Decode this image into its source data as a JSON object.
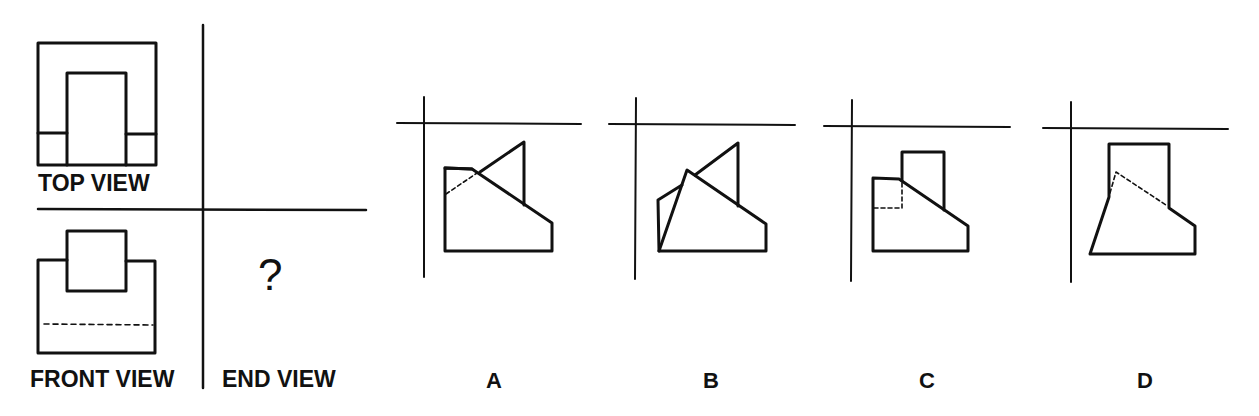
{
  "question": {
    "views": {
      "top_label": "TOP VIEW",
      "front_label": "FRONT VIEW",
      "end_label": "END VIEW",
      "unknown_mark": "?"
    }
  },
  "options": [
    {
      "label": "A"
    },
    {
      "label": "B"
    },
    {
      "label": "C"
    },
    {
      "label": "D"
    }
  ],
  "colors": {
    "stroke": "#111111",
    "background": "#ffffff"
  }
}
